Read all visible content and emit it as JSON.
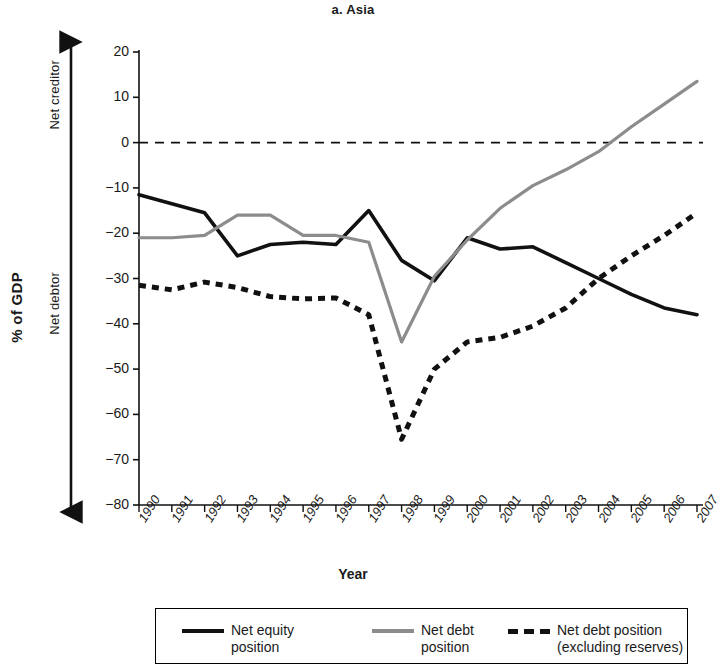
{
  "figure": {
    "title": "a. Asia",
    "x_axis_label": "Year",
    "y_axis_label": "% of GDP",
    "direction_upper": "Net creditor",
    "direction_lower": "Net debtor"
  },
  "legend": {
    "items": [
      {
        "label": "Net equity\nposition",
        "style": "solid",
        "color": "#111111"
      },
      {
        "label": "Net debt\nposition",
        "style": "solid",
        "color": "#8c8c8c"
      },
      {
        "label": "Net debt position\n(excluding reserves)",
        "style": "dashed",
        "color": "#111111"
      }
    ]
  },
  "chart_data": {
    "type": "line",
    "title": "a. Asia",
    "xlabel": "Year",
    "ylabel": "% of GDP",
    "xlim": [
      1990,
      2007
    ],
    "ylim": [
      -80,
      20
    ],
    "ytick_values": [
      20,
      10,
      0,
      -10,
      -20,
      -30,
      -40,
      -50,
      -60,
      -70,
      -80
    ],
    "ytick_labels": [
      "20",
      "10",
      "0",
      "-10",
      "-20",
      "-30",
      "-40",
      "-50",
      "-60",
      "-70",
      "-80"
    ],
    "grid": false,
    "zero_reference_line": 0,
    "legend_position": "below",
    "annotations": [
      "Net creditor",
      "Net debtor"
    ],
    "categories": [
      "1990",
      "1991",
      "1992",
      "1993",
      "1994",
      "1995",
      "1996",
      "1997",
      "1998",
      "1999",
      "2000",
      "2001",
      "2002",
      "2003",
      "2004",
      "2005",
      "2006",
      "2007"
    ],
    "series": [
      {
        "name": "Net equity position",
        "color": "#111111",
        "style": "solid",
        "values": [
          -11.5,
          -13.5,
          -15.5,
          -25.0,
          -22.5,
          -22.0,
          -22.5,
          -15.0,
          -26.0,
          -30.5,
          -21.0,
          -23.5,
          -23.0,
          -26.5,
          -30.0,
          -33.5,
          -36.5,
          -38.0
        ]
      },
      {
        "name": "Net debt position",
        "color": "#8c8c8c",
        "style": "solid",
        "values": [
          -21.0,
          -21.0,
          -20.5,
          -16.0,
          -16.0,
          -20.5,
          -20.5,
          -22.0,
          -44.0,
          -29.5,
          -21.5,
          -14.5,
          -9.5,
          -6.0,
          -2.0,
          3.5,
          8.5,
          13.5
        ]
      },
      {
        "name": "Net debt position (excluding reserves)",
        "color": "#111111",
        "style": "dashed",
        "values": [
          -31.5,
          -32.5,
          -30.8,
          -32.0,
          -34.0,
          -34.5,
          -34.3,
          -38.0,
          -65.5,
          -50.0,
          -44.0,
          -43.0,
          -40.5,
          -36.5,
          -30.0,
          -25.0,
          -20.5,
          -15.5
        ]
      }
    ]
  }
}
